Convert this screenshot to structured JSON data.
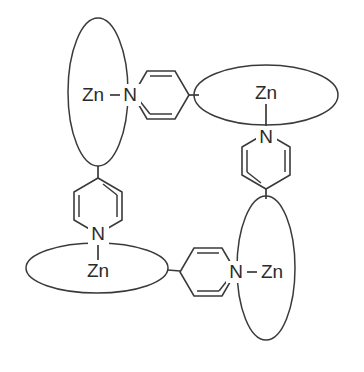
{
  "diagram": {
    "background_color": "#ffffff",
    "stroke_color": "#3a3a3a",
    "label_color": "#2b2b2b",
    "width": 364,
    "height": 372,
    "metal_symbol": "Zn",
    "donor_symbol": "N"
  },
  "macrocycles": [
    {
      "id": "macrocycle-top-left",
      "label": "Zn",
      "orientation": "vertical",
      "cx": 98,
      "cy": 92,
      "rx": 30,
      "ry": 74,
      "label_x": 93,
      "label_y": 95
    },
    {
      "id": "macrocycle-top-right",
      "label": "Zn",
      "orientation": "horizontal",
      "cx": 266,
      "cy": 95,
      "rx": 72,
      "ry": 30,
      "label_x": 266,
      "label_y": 93
    },
    {
      "id": "macrocycle-bottom-left",
      "label": "Zn",
      "orientation": "horizontal",
      "cx": 97,
      "cy": 268,
      "rx": 71,
      "ry": 25,
      "label_x": 98,
      "label_y": 271
    },
    {
      "id": "macrocycle-bottom-right",
      "label": "Zn",
      "orientation": "vertical",
      "cx": 266,
      "cy": 268,
      "rx": 29,
      "ry": 72,
      "label_x": 272,
      "label_y": 272
    }
  ],
  "pyridine_rings": [
    {
      "id": "pyridine-top",
      "orientation": "horizontal",
      "nitrogen_label": "N",
      "nitrogen_x": 130,
      "nitrogen_y": 95,
      "connects_from": "macrocycle-top-left",
      "connects_to": "macrocycle-top-right"
    },
    {
      "id": "pyridine-right",
      "orientation": "vertical",
      "nitrogen_label": "N",
      "nitrogen_x": 266,
      "nitrogen_y": 137,
      "connects_from": "macrocycle-top-right",
      "connects_to": "macrocycle-bottom-right"
    },
    {
      "id": "pyridine-bottom",
      "orientation": "horizontal",
      "nitrogen_label": "N",
      "nitrogen_x": 236,
      "nitrogen_y": 272,
      "connects_from": "macrocycle-bottom-left",
      "connects_to": "macrocycle-bottom-right"
    },
    {
      "id": "pyridine-left",
      "orientation": "vertical",
      "nitrogen_label": "N",
      "nitrogen_x": 98,
      "nitrogen_y": 234,
      "connects_from": "macrocycle-bottom-left",
      "connects_to": "macrocycle-top-left"
    }
  ]
}
